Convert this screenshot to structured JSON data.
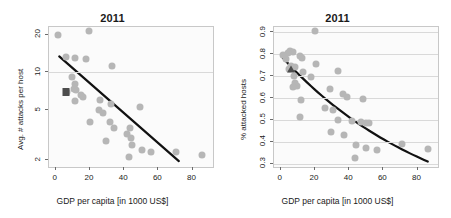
{
  "figure": {
    "background": "#ffffff",
    "point_color": "#b6b6b6",
    "fit_color": "#111111",
    "marker_color": "#4d4d4d",
    "grid_color": "#d9d9d9",
    "panel_bg": "#fbfbfb"
  },
  "chart_data": [
    {
      "type": "scatter",
      "title": "2011",
      "xlabel": "GDP per capita [in 1000 US$]",
      "ylabel": "Avg. # attacks per host",
      "xlim": [
        -4,
        92
      ],
      "ylim": [
        1.75,
        23
      ],
      "yscale": "log",
      "xticks": [
        0,
        20,
        40,
        60,
        80
      ],
      "yticks": [
        2,
        5,
        10,
        20
      ],
      "gridlines_y": [
        10
      ],
      "grid": true,
      "legend": "none",
      "points": [
        {
          "x": 1.5,
          "y": 19.8
        },
        {
          "x": 19.5,
          "y": 21.2
        },
        {
          "x": 6.0,
          "y": 13.3
        },
        {
          "x": 11.5,
          "y": 13.0
        },
        {
          "x": 17.5,
          "y": 12.8
        },
        {
          "x": 33.0,
          "y": 11.3
        },
        {
          "x": 9.5,
          "y": 9.2
        },
        {
          "x": 11.0,
          "y": 8.1
        },
        {
          "x": 10.5,
          "y": 7.4
        },
        {
          "x": 12.0,
          "y": 7.2
        },
        {
          "x": 6.5,
          "y": 7.0
        },
        {
          "x": 14.5,
          "y": 6.6
        },
        {
          "x": 16.0,
          "y": 6.4
        },
        {
          "x": 11.0,
          "y": 5.9
        },
        {
          "x": 26.0,
          "y": 6.0
        },
        {
          "x": 32.0,
          "y": 5.6
        },
        {
          "x": 49.5,
          "y": 5.3
        },
        {
          "x": 25.5,
          "y": 5.0
        },
        {
          "x": 27.5,
          "y": 4.7
        },
        {
          "x": 20.0,
          "y": 4.0
        },
        {
          "x": 31.5,
          "y": 4.0
        },
        {
          "x": 34.0,
          "y": 3.6
        },
        {
          "x": 43.5,
          "y": 3.6
        },
        {
          "x": 41.5,
          "y": 3.2
        },
        {
          "x": 44.0,
          "y": 3.0
        },
        {
          "x": 29.5,
          "y": 2.8
        },
        {
          "x": 44.5,
          "y": 2.6
        },
        {
          "x": 50.5,
          "y": 2.4
        },
        {
          "x": 55.5,
          "y": 2.3
        },
        {
          "x": 70.5,
          "y": 2.3
        },
        {
          "x": 85.5,
          "y": 2.2
        },
        {
          "x": 43.0,
          "y": 2.1
        }
      ],
      "highlight_marker": {
        "x": 6.0,
        "y": 7.0,
        "shape": "square"
      },
      "fit_line": {
        "x0": 2.0,
        "y0": 13.4,
        "x1": 72.0,
        "y1": 1.95,
        "shape": "linear-log"
      }
    },
    {
      "type": "scatter",
      "title": "2011",
      "xlabel": "GDP per capita [in 1000 US$]",
      "ylabel": "% attacked hosts",
      "xlim": [
        -4,
        92
      ],
      "ylim": [
        0.285,
        0.925
      ],
      "yscale": "linear",
      "xticks": [
        0,
        20,
        40,
        60,
        80
      ],
      "yticks": [
        0.3,
        0.4,
        0.5,
        0.6,
        0.7,
        0.8,
        0.9
      ],
      "gridlines_y": [
        0.3,
        0.4,
        0.5,
        0.6,
        0.7,
        0.8,
        0.9
      ],
      "grid": true,
      "legend": "none",
      "points": [
        {
          "x": 20.0,
          "y": 0.905
        },
        {
          "x": 5.5,
          "y": 0.815
        },
        {
          "x": 7.0,
          "y": 0.812
        },
        {
          "x": 4.0,
          "y": 0.805
        },
        {
          "x": 1.5,
          "y": 0.795
        },
        {
          "x": 11.0,
          "y": 0.793
        },
        {
          "x": 12.5,
          "y": 0.785
        },
        {
          "x": 3.0,
          "y": 0.78
        },
        {
          "x": 20.5,
          "y": 0.755
        },
        {
          "x": 6.0,
          "y": 0.745
        },
        {
          "x": 8.5,
          "y": 0.74
        },
        {
          "x": 5.0,
          "y": 0.735
        },
        {
          "x": 13.0,
          "y": 0.72
        },
        {
          "x": 33.5,
          "y": 0.725
        },
        {
          "x": 7.5,
          "y": 0.7
        },
        {
          "x": 17.5,
          "y": 0.695
        },
        {
          "x": 8.0,
          "y": 0.67
        },
        {
          "x": 9.5,
          "y": 0.655
        },
        {
          "x": 7.0,
          "y": 0.65
        },
        {
          "x": 28.5,
          "y": 0.64
        },
        {
          "x": 36.5,
          "y": 0.62
        },
        {
          "x": 39.0,
          "y": 0.605
        },
        {
          "x": 48.0,
          "y": 0.595
        },
        {
          "x": 12.0,
          "y": 0.59
        },
        {
          "x": 26.0,
          "y": 0.555
        },
        {
          "x": 30.5,
          "y": 0.545
        },
        {
          "x": 11.5,
          "y": 0.512
        },
        {
          "x": 33.5,
          "y": 0.5
        },
        {
          "x": 41.5,
          "y": 0.495
        },
        {
          "x": 47.0,
          "y": 0.49
        },
        {
          "x": 50.0,
          "y": 0.488
        },
        {
          "x": 51.5,
          "y": 0.487
        },
        {
          "x": 29.5,
          "y": 0.443
        },
        {
          "x": 37.0,
          "y": 0.43
        },
        {
          "x": 44.0,
          "y": 0.385
        },
        {
          "x": 71.0,
          "y": 0.39
        },
        {
          "x": 50.0,
          "y": 0.372
        },
        {
          "x": 86.0,
          "y": 0.368
        },
        {
          "x": 56.5,
          "y": 0.365
        },
        {
          "x": 43.5,
          "y": 0.325
        }
      ],
      "highlight_marker": {
        "x": 6.0,
        "y": 0.735,
        "shape": "triangle"
      },
      "fit_line": {
        "x0": 0.5,
        "y0": 0.79,
        "x1": 86.0,
        "y1": 0.31,
        "shape": "exponential-decay"
      }
    }
  ]
}
